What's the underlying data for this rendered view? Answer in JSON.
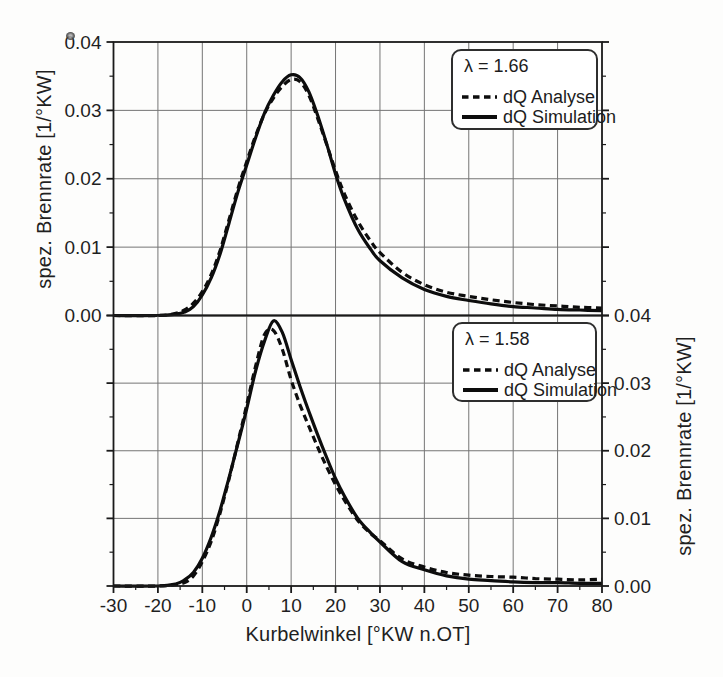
{
  "figure": {
    "background": "#ffffff",
    "line_color": "#0d0d0d",
    "grid_color": "#757575",
    "axis_color": "#1a1a1a"
  },
  "axes": {
    "xlabel": "Kurbelwinkel [°KW n.OT]",
    "ylabel_left": "spez. Brennrate [1/°KW]",
    "ylabel_right": "spez. Brennrate [1/°KW]"
  },
  "chart_data": [
    {
      "type": "line",
      "position": "top",
      "annotation": "λ = 1.66",
      "xlabel": "Kurbelwinkel [°KW n.OT]",
      "ylabel": "spez. Brennrate [1/°KW]",
      "ylabel_side": "left",
      "xlim": [
        -30,
        80
      ],
      "ylim": [
        0,
        0.04
      ],
      "grid": true,
      "legend_position": "upper right",
      "x_ticks": {
        "values": [
          -30,
          -20,
          -10,
          0,
          10,
          20,
          30,
          40,
          50,
          60,
          70,
          80
        ],
        "labels": [
          "-30",
          "-20",
          "-10",
          "0",
          "10",
          "20",
          "30",
          "40",
          "50",
          "60",
          "70",
          "80"
        ]
      },
      "y_ticks": {
        "values": [
          0,
          0.01,
          0.02,
          0.03,
          0.04
        ],
        "labels": [
          "0.00",
          "0.01",
          "0.02",
          "0.03",
          "0.04"
        ]
      },
      "x": [
        -30,
        -20,
        -16,
        -14,
        -12,
        -10,
        -8,
        -6,
        -4,
        -2,
        0,
        2,
        4,
        6,
        8,
        10,
        12,
        14,
        16,
        18,
        20,
        22,
        25,
        28,
        30,
        35,
        40,
        45,
        50,
        55,
        60,
        65,
        70,
        75,
        80
      ],
      "series": [
        {
          "name": "dQ Analyse",
          "line_style": "dashed",
          "values": [
            0,
            0,
            0.0003,
            0.0008,
            0.0018,
            0.0035,
            0.006,
            0.0095,
            0.014,
            0.0185,
            0.0225,
            0.0263,
            0.0295,
            0.0318,
            0.0335,
            0.0345,
            0.0342,
            0.0322,
            0.0288,
            0.025,
            0.0212,
            0.0178,
            0.0138,
            0.0108,
            0.0092,
            0.0063,
            0.0045,
            0.0034,
            0.0028,
            0.0023,
            0.0019,
            0.0016,
            0.0014,
            0.0012,
            0.0011
          ]
        },
        {
          "name": "dQ Simulation",
          "line_style": "solid",
          "values": [
            0,
            0,
            0.0002,
            0.0005,
            0.0013,
            0.003,
            0.0055,
            0.009,
            0.0135,
            0.018,
            0.022,
            0.026,
            0.0296,
            0.0322,
            0.0342,
            0.0352,
            0.0348,
            0.0327,
            0.0292,
            0.0251,
            0.0207,
            0.017,
            0.0126,
            0.0096,
            0.008,
            0.0055,
            0.0038,
            0.0028,
            0.0022,
            0.0017,
            0.0013,
            0.0011,
            0.0009,
            0.0008,
            0.0007
          ]
        }
      ]
    },
    {
      "type": "line",
      "position": "bottom",
      "annotation": "λ = 1.58",
      "xlabel": "Kurbelwinkel [°KW n.OT]",
      "ylabel": "spez. Brennrate [1/°KW]",
      "ylabel_side": "right",
      "xlim": [
        -30,
        80
      ],
      "ylim": [
        0,
        0.04
      ],
      "grid": true,
      "legend_position": "upper right",
      "x_ticks": {
        "values": [
          -30,
          -20,
          -10,
          0,
          10,
          20,
          30,
          40,
          50,
          60,
          70,
          80
        ],
        "labels": [
          "-30",
          "-20",
          "-10",
          "0",
          "10",
          "20",
          "30",
          "40",
          "50",
          "60",
          "70",
          "80"
        ]
      },
      "y_ticks": {
        "values": [
          0,
          0.01,
          0.02,
          0.03,
          0.04
        ],
        "labels": [
          "0.00",
          "0.01",
          "0.02",
          "0.03",
          "0.04"
        ]
      },
      "x": [
        -30,
        -20,
        -16,
        -14,
        -12,
        -10,
        -8,
        -6,
        -4,
        -2,
        0,
        2,
        4,
        6,
        8,
        10,
        12,
        14,
        16,
        18,
        20,
        22,
        25,
        28,
        30,
        35,
        40,
        45,
        50,
        55,
        60,
        65,
        70,
        75,
        80
      ],
      "series": [
        {
          "name": "dQ Analyse",
          "line_style": "dashed",
          "values": [
            0,
            0,
            0.0002,
            0.0005,
            0.0015,
            0.0036,
            0.0066,
            0.0108,
            0.0158,
            0.0212,
            0.0268,
            0.0325,
            0.0372,
            0.0378,
            0.035,
            0.0305,
            0.0268,
            0.0236,
            0.0205,
            0.0176,
            0.015,
            0.0127,
            0.0097,
            0.0077,
            0.0067,
            0.004,
            0.0028,
            0.002,
            0.0016,
            0.0014,
            0.0013,
            0.0011,
            0.001,
            0.0009,
            0.001
          ]
        },
        {
          "name": "dQ Simulation",
          "line_style": "solid",
          "values": [
            0,
            0,
            0.0003,
            0.0009,
            0.002,
            0.0041,
            0.0072,
            0.0112,
            0.016,
            0.021,
            0.0262,
            0.0318,
            0.0362,
            0.0392,
            0.0375,
            0.0335,
            0.0295,
            0.0258,
            0.0223,
            0.019,
            0.0159,
            0.0133,
            0.01,
            0.0078,
            0.0065,
            0.0036,
            0.0024,
            0.0015,
            0.001,
            0.0008,
            0.0006,
            0.0005,
            0.0005,
            0.0004,
            0.0004
          ]
        }
      ]
    }
  ]
}
